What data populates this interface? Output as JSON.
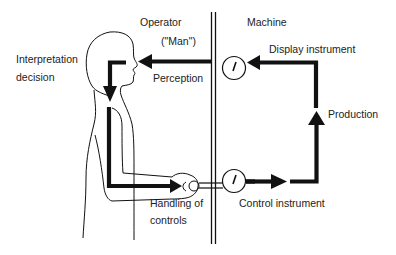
{
  "diagram": {
    "type": "man-machine-system",
    "colors": {
      "stroke": "#111111",
      "background": "#ffffff",
      "text": "#222222"
    },
    "labels": {
      "operator": "Operator",
      "man": "(\"Man\")",
      "machine": "Machine",
      "interpretation_line1": "Interpretation",
      "interpretation_line2": "decision",
      "perception": "Perception",
      "display_instrument": "Display instrument",
      "production": "Production",
      "handling_line1": "Handling of",
      "handling_line2": "controls",
      "control_instrument": "Control instrument"
    },
    "nodes": [
      {
        "id": "operator",
        "label": "Operator (\"Man\")",
        "icon": "human-silhouette-icon"
      },
      {
        "id": "display",
        "label": "Display instrument",
        "icon": "dial-gauge-icon"
      },
      {
        "id": "control",
        "label": "Control instrument",
        "icon": "dial-gauge-icon"
      }
    ],
    "edges": [
      {
        "from": "display",
        "to": "operator",
        "label": "Perception"
      },
      {
        "from": "operator",
        "to": "operator",
        "label": "Interpretation decision"
      },
      {
        "from": "operator",
        "to": "control",
        "label": "Handling of controls"
      },
      {
        "from": "control",
        "to": "display",
        "label": "Production"
      }
    ]
  }
}
